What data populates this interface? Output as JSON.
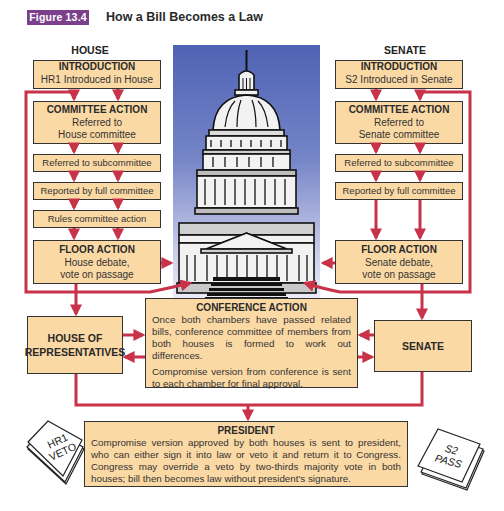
{
  "figure": {
    "badge": "Figure 13.4",
    "title": "How a Bill Becomes a Law",
    "badge_color": "#7b3f8c"
  },
  "colors": {
    "box_fill": "#fbd9a5",
    "arrow": "#c8334a",
    "sky_top": "#4f63b5"
  },
  "house": {
    "label": "HOUSE",
    "introduction": {
      "title": "INTRODUCTION",
      "text": "HR1 Introduced in House"
    },
    "committee": {
      "title": "COMMITTEE ACTION",
      "line1": "Referred to",
      "line2": "House committee"
    },
    "steps": [
      "Referred to subcommittee",
      "Reported by full committee",
      "Rules committee action"
    ],
    "floor": {
      "title": "FLOOR ACTION",
      "line1": "House debate,",
      "line2": "vote on passage"
    },
    "chamber": {
      "line1": "HOUSE OF",
      "line2": "REPRESENTATIVES"
    }
  },
  "senate": {
    "label": "SENATE",
    "introduction": {
      "title": "INTRODUCTION",
      "text": "S2 Introduced in Senate"
    },
    "committee": {
      "title": "COMMITTEE ACTION",
      "line1": "Referred to",
      "line2": "Senate committee"
    },
    "steps": [
      "Referred to subcommittee",
      "Reported by full committee"
    ],
    "floor": {
      "title": "FLOOR ACTION",
      "line1": "Senate debate,",
      "line2": "vote on passage"
    },
    "chamber": {
      "line1": "SENATE"
    }
  },
  "conference": {
    "title": "CONFERENCE ACTION",
    "para1": "Once both chambers have passed related bills, conference committee of members from both houses is formed to work out differences.",
    "para2": "Compromise version from conference is sent to each chamber for final approval."
  },
  "president": {
    "title": "PRESIDENT",
    "text": "Compromise version approved by both houses is sent to president, who can either sign it into law or veto it and return it to Congress. Congress may override a veto by two-thirds majority vote in both houses; bill then becomes law without president's signature."
  },
  "slips": {
    "left": {
      "line1": "HR1",
      "line2": "VETO"
    },
    "right": {
      "line1": "S2",
      "line2": "PASS"
    }
  }
}
